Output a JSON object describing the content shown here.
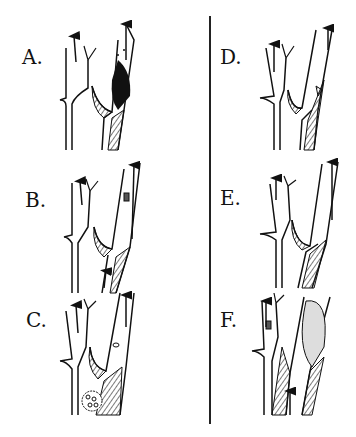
{
  "figure": {
    "type": "anatomical-illustration",
    "panels": [
      {
        "id": "A",
        "label": "A.",
        "x": 22,
        "y": 48
      },
      {
        "id": "B",
        "label": "B.",
        "x": 25,
        "y": 193
      },
      {
        "id": "C",
        "label": "C.",
        "x": 26,
        "y": 312
      },
      {
        "id": "D",
        "label": "D.",
        "x": 220,
        "y": 48
      },
      {
        "id": "E",
        "label": "E.",
        "x": 220,
        "y": 188
      },
      {
        "id": "F",
        "label": "F.",
        "x": 220,
        "y": 312
      }
    ],
    "colors": {
      "ink": "#111111",
      "background": "#ffffff",
      "hatch": "#333333"
    }
  }
}
